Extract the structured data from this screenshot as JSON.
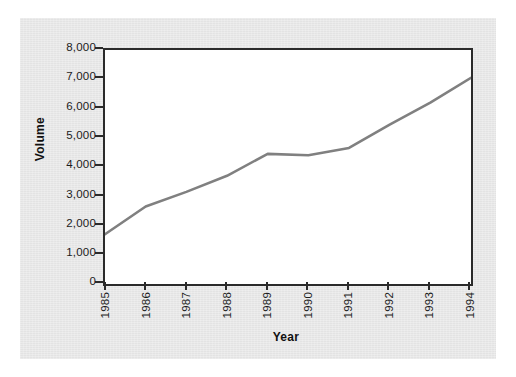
{
  "figure": {
    "background_color": "#e9e9e9",
    "plot_background_color": "#ffffff",
    "axis_color": "#2b2b2b",
    "line_color": "#808080"
  },
  "chart_data": {
    "type": "line",
    "title": "",
    "xlabel": "Year",
    "ylabel": "Volume",
    "categories": [
      "1985",
      "1986",
      "1987",
      "1988",
      "1989",
      "1990",
      "1991",
      "1992",
      "1993",
      "1994"
    ],
    "x": [
      1985,
      1986,
      1987,
      1988,
      1989,
      1990,
      1991,
      1992,
      1993,
      1994
    ],
    "values": [
      1700,
      2650,
      3150,
      3700,
      4450,
      4400,
      4650,
      5450,
      6200,
      7050
    ],
    "series": [
      {
        "name": "Volume",
        "color": "#808080",
        "values": [
          1700,
          2650,
          3150,
          3700,
          4450,
          4400,
          4650,
          5450,
          6200,
          7050
        ]
      }
    ],
    "ylim": [
      0,
      8000
    ],
    "xlim": [
      1985,
      1994
    ],
    "ytick_labels": [
      "0",
      "1,000",
      "2,000",
      "3,000",
      "4,000",
      "5,000",
      "6,000",
      "7,000",
      "8,000"
    ],
    "ytick_values": [
      0,
      1000,
      2000,
      3000,
      4000,
      5000,
      6000,
      7000,
      8000
    ],
    "xtick_labels": [
      "1985",
      "1986",
      "1987",
      "1988",
      "1989",
      "1990",
      "1991",
      "1992",
      "1993",
      "1994"
    ],
    "grid": false,
    "legend": null,
    "legend_position": "none",
    "annotations": []
  }
}
